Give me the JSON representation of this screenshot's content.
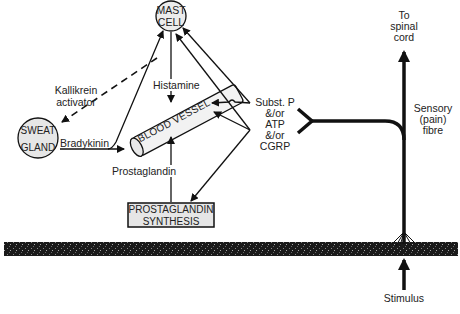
{
  "diagram": {
    "nodes": {
      "mast_cell": {
        "line1": "MAST",
        "line2": "CELL"
      },
      "sweat_gland": {
        "line1": "SWEAT",
        "line2": "GLAND"
      },
      "blood_vessel": {
        "label": "BLOOD VESSEL"
      },
      "prostaglandin_synthesis": {
        "line1": "PROSTAGLANDIN",
        "line2": "SYNTHESIS"
      }
    },
    "labels": {
      "kallikrein_line1": "Kallikrein",
      "kallikrein_line2": "activator",
      "histamine": "Histamine",
      "bradykinin": "Bradykinin",
      "prostaglandin": "Prostaglandin",
      "substances": [
        "Subst. P",
        "&/or",
        "ATP",
        "&/or",
        "CGRP"
      ],
      "to_spinal_cord": [
        "To",
        "spinal",
        "cord"
      ],
      "sensory_fibre": [
        "Sensory",
        "(pain)",
        "fibre"
      ],
      "stimulus": "Stimulus"
    },
    "edges": [
      {
        "from": "mast_cell",
        "to": "sweat_gland",
        "label": "Kallikrein activator",
        "style": "dashed"
      },
      {
        "from": "mast_cell",
        "to": "blood_vessel",
        "label": "Histamine"
      },
      {
        "from": "sweat_gland",
        "to": "blood_vessel",
        "label": "Bradykinin"
      },
      {
        "from": "sweat_gland",
        "to": "mast_cell"
      },
      {
        "from": "prostaglandin_synthesis",
        "to": "blood_vessel",
        "label": "Prostaglandin"
      },
      {
        "from": "substances",
        "to": "mast_cell"
      },
      {
        "from": "substances",
        "to": "blood_vessel"
      },
      {
        "from": "substances",
        "to": "prostaglandin_synthesis"
      },
      {
        "from": "stimulus",
        "to": "sensory_fibre"
      },
      {
        "from": "sensory_fibre",
        "to": "spinal_cord"
      }
    ],
    "colors": {
      "line": "#111111",
      "fill": "#e6e6e6",
      "skin": "#1a1a1a"
    }
  }
}
